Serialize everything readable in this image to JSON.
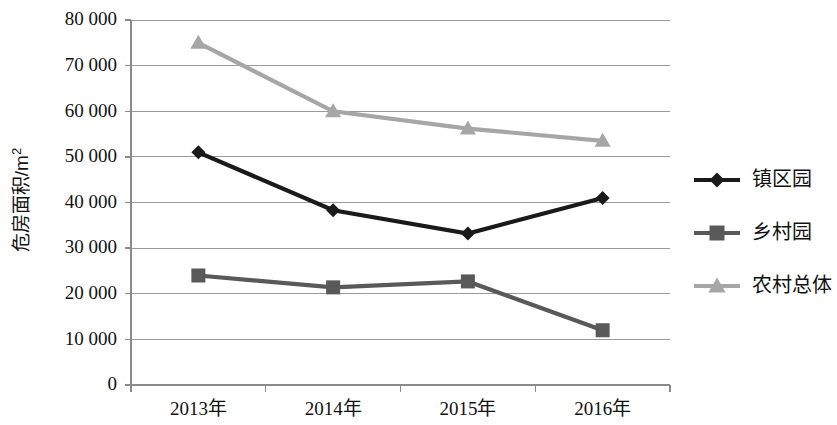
{
  "chart_data": {
    "type": "line",
    "title": "",
    "subtitle": "",
    "xlabel": "",
    "ylabel": "危房面积/m²",
    "categories": [
      "2013年",
      "2014年",
      "2015年",
      "2016年"
    ],
    "ylim": [
      0,
      80000
    ],
    "ytick_step": 10000,
    "ytick_labels": [
      "0",
      "10 000",
      "20 000",
      "30 000",
      "40 000",
      "50 000",
      "60 000",
      "70 000",
      "80 000"
    ],
    "ytick_values": [
      0,
      10000,
      20000,
      30000,
      40000,
      50000,
      60000,
      70000,
      80000
    ],
    "grid": "horizontal",
    "legend_position": "right",
    "series": [
      {
        "name": "镇区园",
        "marker": "diamond",
        "color": "#1a1a1a",
        "values": [
          51000,
          38300,
          33200,
          41000
        ]
      },
      {
        "name": "乡村园",
        "marker": "square",
        "color": "#595959",
        "values": [
          24000,
          21400,
          22700,
          12000
        ]
      },
      {
        "name": "农村总体",
        "marker": "triangle",
        "color": "#a6a6a6",
        "values": [
          75000,
          60000,
          56200,
          53500
        ]
      }
    ]
  },
  "axis": {
    "y_title": "危房面积/m²",
    "y_title_base": "危房面积/m",
    "y_title_exponent": "2"
  },
  "legend": {
    "items": [
      {
        "label": "镇区园",
        "marker": "diamond-marker-icon",
        "color": "#1a1a1a"
      },
      {
        "label": "乡村园",
        "marker": "square-marker-icon",
        "color": "#595959"
      },
      {
        "label": "农村总体",
        "marker": "triangle-marker-icon",
        "color": "#a6a6a6"
      }
    ]
  }
}
